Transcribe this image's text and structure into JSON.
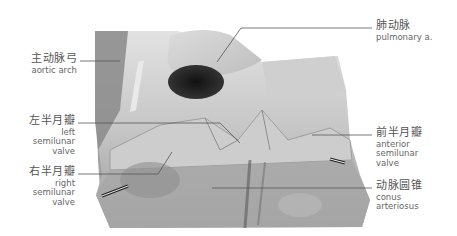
{
  "figure": {
    "labels": [
      {
        "id": "aortic-arch",
        "zh": "主动脉弓",
        "en": "aortic arch",
        "side": "left"
      },
      {
        "id": "pulmonary-a",
        "zh": "肺动脉",
        "en": "pulmonary a.",
        "side": "right"
      },
      {
        "id": "left-semilunar-valve",
        "zh": "左半月瓣",
        "en": "left\nsemilunar\nvalve",
        "side": "left"
      },
      {
        "id": "right-semilunar-valve",
        "zh": "右半月瓣",
        "en": "right\nsemilunar\nvalve",
        "side": "left"
      },
      {
        "id": "anterior-semilunar-valve",
        "zh": "前半月瓣",
        "en": "anterior\nsemilunar\nvalve",
        "side": "right"
      },
      {
        "id": "conus-arteriosus",
        "zh": "动脉圆锥",
        "en": "conus\narteriosus",
        "side": "right"
      }
    ],
    "colors": {
      "background": "#ffffff",
      "leader_line": "#555555",
      "label_text": "#555555"
    }
  }
}
